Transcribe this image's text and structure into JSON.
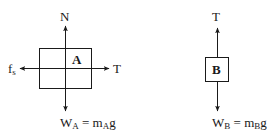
{
  "diagram": {
    "title": "",
    "type": "free-body-diagram",
    "stroke_color": "#1a1a1a",
    "body_a": {
      "label": "A",
      "forces": {
        "up": {
          "symbol": "N"
        },
        "left": {
          "symbol": "f",
          "subscript": "s"
        },
        "right": {
          "symbol": "T"
        },
        "down": {
          "symbol": "W",
          "subscript": "A",
          "equals": " = m",
          "mass_subscript": "A",
          "tail": "g"
        }
      }
    },
    "body_b": {
      "label": "B",
      "forces": {
        "up": {
          "symbol": "T"
        },
        "down": {
          "symbol": "W",
          "subscript": "B",
          "equals": " = m",
          "mass_subscript": "B",
          "tail": "g"
        }
      }
    }
  }
}
